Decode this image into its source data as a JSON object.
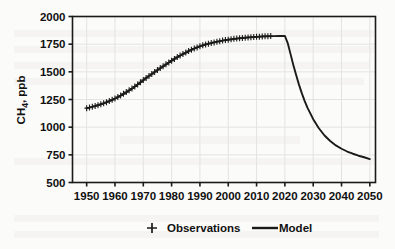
{
  "chart_data": {
    "type": "line",
    "title": "",
    "xlabel": "",
    "ylabel": "CH4, ppb",
    "ylabel_base": "CH",
    "ylabel_sub": "4",
    "ylabel_rest": ", ppb",
    "xlim": [
      1945,
      2052
    ],
    "ylim": [
      500,
      2000
    ],
    "xticks": [
      1950,
      1960,
      1970,
      1980,
      1990,
      2000,
      2010,
      2020,
      2030,
      2040,
      2050
    ],
    "yticks": [
      500,
      750,
      1000,
      1250,
      1500,
      1750,
      2000
    ],
    "grid": true,
    "legend_position": "bottom",
    "legend": [
      {
        "label": "Observations",
        "marker": "plus",
        "color": "#1a1a1a"
      },
      {
        "label": "Model",
        "marker": "line",
        "color": "#1a1a1a"
      }
    ],
    "series": [
      {
        "name": "Model",
        "marker": "line",
        "color": "#1a1a1a",
        "x": [
          1950,
          1952,
          1954,
          1956,
          1958,
          1960,
          1962,
          1964,
          1966,
          1968,
          1970,
          1972,
          1974,
          1976,
          1978,
          1980,
          1982,
          1984,
          1986,
          1988,
          1990,
          1992,
          1994,
          1996,
          1998,
          2000,
          2002,
          2004,
          2006,
          2008,
          2010,
          2012,
          2014,
          2016,
          2018,
          2020,
          2021,
          2022,
          2023,
          2024,
          2025,
          2026,
          2027,
          2028,
          2030,
          2032,
          2034,
          2036,
          2038,
          2040,
          2042,
          2044,
          2046,
          2048,
          2050
        ],
        "y": [
          1170,
          1183,
          1198,
          1215,
          1235,
          1258,
          1285,
          1315,
          1348,
          1385,
          1425,
          1462,
          1498,
          1533,
          1567,
          1600,
          1632,
          1660,
          1687,
          1710,
          1730,
          1747,
          1760,
          1772,
          1782,
          1790,
          1797,
          1803,
          1808,
          1812,
          1816,
          1819,
          1821,
          1823,
          1824,
          1825,
          1760,
          1660,
          1560,
          1468,
          1382,
          1305,
          1236,
          1175,
          1072,
          990,
          925,
          875,
          835,
          805,
          780,
          760,
          742,
          728,
          712
        ]
      },
      {
        "name": "Observations",
        "marker": "plus",
        "color": "#1a1a1a",
        "x": [
          1950,
          1951,
          1952,
          1953,
          1954,
          1955,
          1956,
          1957,
          1958,
          1959,
          1960,
          1961,
          1962,
          1963,
          1964,
          1965,
          1966,
          1967,
          1968,
          1969,
          1970,
          1971,
          1972,
          1973,
          1974,
          1975,
          1976,
          1977,
          1978,
          1979,
          1980,
          1981,
          1982,
          1983,
          1984,
          1985,
          1986,
          1987,
          1988,
          1989,
          1990,
          1991,
          1992,
          1993,
          1994,
          1995,
          1996,
          1997,
          1998,
          1999,
          2000,
          2001,
          2002,
          2003,
          2004,
          2005,
          2006,
          2007,
          2008,
          2009,
          2010,
          2011,
          2012,
          2013,
          2014,
          2015
        ],
        "y": [
          1172,
          1178,
          1185,
          1191,
          1199,
          1207,
          1216,
          1225,
          1236,
          1247,
          1259,
          1272,
          1286,
          1301,
          1317,
          1333,
          1350,
          1368,
          1386,
          1406,
          1426,
          1444,
          1463,
          1481,
          1499,
          1516,
          1534,
          1550,
          1568,
          1584,
          1601,
          1617,
          1633,
          1647,
          1661,
          1674,
          1688,
          1699,
          1711,
          1721,
          1731,
          1740,
          1748,
          1754,
          1761,
          1766,
          1772,
          1777,
          1783,
          1787,
          1791,
          1794,
          1798,
          1801,
          1804,
          1806,
          1809,
          1811,
          1813,
          1815,
          1817,
          1818,
          1820,
          1821,
          1822,
          1823
        ]
      }
    ]
  }
}
